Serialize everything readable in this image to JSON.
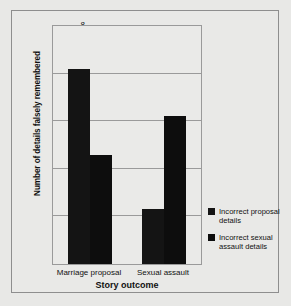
{
  "chart_data": {
    "type": "bar",
    "title": "",
    "xlabel": "Story outcome",
    "ylabel": "Number of details falsely remembered",
    "categories": [
      "Marriage proposal",
      "Sexual assault"
    ],
    "series": [
      {
        "name": "Incorrect proposal details",
        "values": [
          7.1,
          4.15
        ],
        "color": "#141414"
      },
      {
        "name": "Incorrect sexual assault details",
        "values": [
          5.3,
          6.1
        ],
        "color": "#0d0d0d"
      }
    ],
    "ylim": [
      3,
      8
    ],
    "yticks": [
      3,
      4,
      5,
      6,
      7,
      8
    ],
    "ytick_labels": [
      "3",
      "4",
      "5",
      "6",
      "7",
      "8"
    ],
    "grid": true,
    "legend_position": "right"
  },
  "legend": {
    "entries": [
      {
        "label": "Incorrect proposal details"
      },
      {
        "label": "Incorrect sexual assault details"
      }
    ]
  }
}
